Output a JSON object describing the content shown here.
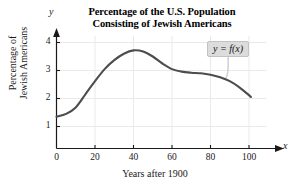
{
  "chart_data": {
    "type": "line",
    "title": "Percentage of the U.S. Population Consisting of Jewish Americans",
    "title_line1": "Percentage of the U.S. Population",
    "title_line2": "Consisting of Jewish Americans",
    "xlabel": "Years after 1900",
    "ylabel": "Percentage of Jewish Americans",
    "ylabel_line1": "Percentage of",
    "ylabel_line2": "Jewish Americans",
    "x_axis_name": "x",
    "y_axis_name": "y",
    "xlim": [
      0,
      107
    ],
    "ylim": [
      0,
      4.45
    ],
    "xticks": [
      0,
      20,
      40,
      60,
      80,
      100
    ],
    "yticks": [
      1,
      2,
      3,
      4
    ],
    "xtick_labels": [
      "0",
      "20",
      "40",
      "60",
      "80",
      "100"
    ],
    "ytick_labels": [
      "1",
      "2",
      "3",
      "4"
    ],
    "grid": true,
    "legend": "none",
    "annotations": [
      {
        "text": "y = f(x)",
        "at_x": 88,
        "at_y": 2.72,
        "box_x": 90,
        "box_y": 3.85
      }
    ],
    "series": [
      {
        "name": "f(x)",
        "color": "#4d4d4d",
        "x": [
          0,
          5,
          10,
          15,
          20,
          25,
          30,
          35,
          40,
          45,
          50,
          55,
          60,
          65,
          70,
          75,
          80,
          85,
          90,
          95,
          100,
          101
        ],
        "y": [
          1.35,
          1.45,
          1.68,
          2.15,
          2.62,
          3.05,
          3.37,
          3.6,
          3.72,
          3.68,
          3.5,
          3.25,
          3.05,
          2.96,
          2.92,
          2.9,
          2.85,
          2.76,
          2.62,
          2.4,
          2.12,
          2.05
        ]
      }
    ]
  },
  "colors": {
    "curve": "#4d4d4d",
    "axis": "#1a1a1a",
    "grid": "#e9e9e9",
    "callout_bg": "#dcdcdc",
    "callout_border": "#c2c2c2",
    "background": "#ffffff"
  }
}
